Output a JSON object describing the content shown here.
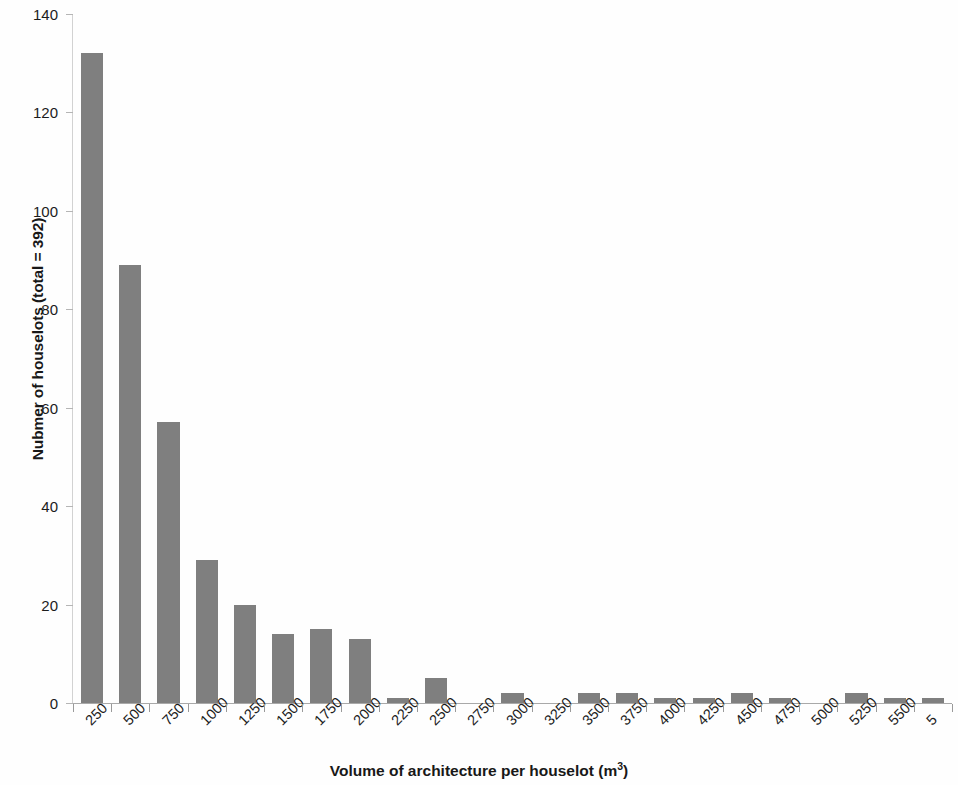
{
  "chart_data": {
    "type": "bar",
    "title": "",
    "subtitle": "",
    "xlabel": "Volume of architecture per houselot (m³)",
    "ylabel": "Nubmer of houselots (total = 392)",
    "categories": [
      "250",
      "500",
      "750",
      "1000",
      "1250",
      "1500",
      "1750",
      "2000",
      "2250",
      "2500",
      "2750",
      "3000",
      "3250",
      "3500",
      "3750",
      "4000",
      "4250",
      "4500",
      "4750",
      "5000",
      "5250",
      "5500",
      "5"
    ],
    "values": [
      132,
      89,
      57,
      29,
      20,
      14,
      15,
      13,
      1,
      5,
      0,
      2,
      0,
      2,
      2,
      1,
      1,
      2,
      1,
      0,
      2,
      1,
      1
    ],
    "ylim": [
      0,
      140
    ],
    "yticks": [
      0,
      20,
      40,
      60,
      80,
      100,
      120,
      140
    ],
    "ytick_labels": [
      "0",
      "20",
      "40",
      "60",
      "80",
      "100",
      "120",
      "140"
    ],
    "grid": false,
    "legend": "none",
    "bar_color": "#7f7f7f",
    "axis_color": "#a9a9a9",
    "text_color": "#1c1c1c",
    "total_label": "392",
    "last_label_truncated": true,
    "xtick_label_rotation": -45
  }
}
